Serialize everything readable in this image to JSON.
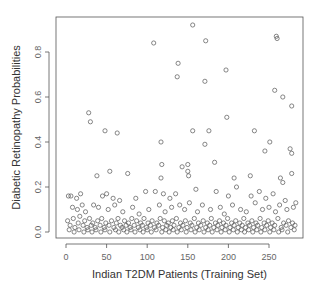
{
  "chart_data": {
    "type": "scatter",
    "title": "",
    "xlabel": "Indian T2DM Patients (Training Set)",
    "ylabel": "Diabetic Retinopathy Probabilities",
    "xlim": [
      -7,
      297
    ],
    "ylim": [
      -0.02,
      0.94
    ],
    "xticks": [
      0,
      50,
      100,
      150,
      200,
      250
    ],
    "yticks": [
      0.0,
      0.2,
      0.4,
      0.6,
      0.8
    ],
    "xtick_labels": [
      "0",
      "50",
      "100",
      "150",
      "200",
      "250"
    ],
    "ytick_labels": [
      "0.0",
      "0.2",
      "0.4",
      "0.6",
      "0.8"
    ],
    "grid": false,
    "legend": null,
    "marker": "open-circle",
    "marker_color": "#555555",
    "points": [
      [
        156,
        0.92
      ],
      [
        108,
        0.84
      ],
      [
        172,
        0.85
      ],
      [
        259,
        0.87
      ],
      [
        260,
        0.86
      ],
      [
        138,
        0.75
      ],
      [
        137,
        0.69
      ],
      [
        197,
        0.72
      ],
      [
        171,
        0.67
      ],
      [
        257,
        0.63
      ],
      [
        267,
        0.6
      ],
      [
        278,
        0.56
      ],
      [
        28,
        0.53
      ],
      [
        30,
        0.49
      ],
      [
        198,
        0.51
      ],
      [
        48,
        0.45
      ],
      [
        63,
        0.44
      ],
      [
        117,
        0.4
      ],
      [
        156,
        0.45
      ],
      [
        176,
        0.45
      ],
      [
        232,
        0.45
      ],
      [
        171,
        0.39
      ],
      [
        251,
        0.4
      ],
      [
        245,
        0.36
      ],
      [
        276,
        0.37
      ],
      [
        278,
        0.35
      ],
      [
        118,
        0.3
      ],
      [
        143,
        0.29
      ],
      [
        150,
        0.3
      ],
      [
        183,
        0.31
      ],
      [
        38,
        0.25
      ],
      [
        54,
        0.27
      ],
      [
        76,
        0.26
      ],
      [
        150,
        0.27
      ],
      [
        151,
        0.25
      ],
      [
        117,
        0.24
      ],
      [
        207,
        0.24
      ],
      [
        227,
        0.25
      ],
      [
        278,
        0.26
      ],
      [
        264,
        0.24
      ],
      [
        267,
        0.22
      ],
      [
        3,
        0.16
      ],
      [
        6,
        0.16
      ],
      [
        13,
        0.15
      ],
      [
        18,
        0.17
      ],
      [
        45,
        0.16
      ],
      [
        50,
        0.17
      ],
      [
        58,
        0.15
      ],
      [
        66,
        0.14
      ],
      [
        86,
        0.15
      ],
      [
        98,
        0.18
      ],
      [
        110,
        0.18
      ],
      [
        120,
        0.17
      ],
      [
        128,
        0.15
      ],
      [
        135,
        0.17
      ],
      [
        160,
        0.19
      ],
      [
        185,
        0.18
      ],
      [
        200,
        0.16
      ],
      [
        210,
        0.2
      ],
      [
        228,
        0.16
      ],
      [
        238,
        0.18
      ],
      [
        246,
        0.15
      ],
      [
        255,
        0.17
      ],
      [
        270,
        0.14
      ],
      [
        283,
        0.13
      ],
      [
        8,
        0.11
      ],
      [
        14,
        0.1
      ],
      [
        20,
        0.12
      ],
      [
        24,
        0.09
      ],
      [
        34,
        0.12
      ],
      [
        40,
        0.11
      ],
      [
        52,
        0.1
      ],
      [
        60,
        0.12
      ],
      [
        70,
        0.09
      ],
      [
        82,
        0.11
      ],
      [
        90,
        0.08
      ],
      [
        102,
        0.1
      ],
      [
        115,
        0.12
      ],
      [
        122,
        0.09
      ],
      [
        130,
        0.11
      ],
      [
        140,
        0.12
      ],
      [
        146,
        0.1
      ],
      [
        152,
        0.13
      ],
      [
        162,
        0.09
      ],
      [
        168,
        0.12
      ],
      [
        178,
        0.1
      ],
      [
        190,
        0.11
      ],
      [
        195,
        0.08
      ],
      [
        205,
        0.12
      ],
      [
        215,
        0.1
      ],
      [
        222,
        0.09
      ],
      [
        233,
        0.13
      ],
      [
        242,
        0.1
      ],
      [
        250,
        0.11
      ],
      [
        258,
        0.09
      ],
      [
        263,
        0.12
      ],
      [
        272,
        0.1
      ],
      [
        280,
        0.11
      ],
      [
        2,
        0.05
      ],
      [
        5,
        0.03
      ],
      [
        9,
        0.06
      ],
      [
        11,
        0.02
      ],
      [
        15,
        0.04
      ],
      [
        17,
        0.07
      ],
      [
        21,
        0.03
      ],
      [
        23,
        0.05
      ],
      [
        26,
        0.02
      ],
      [
        29,
        0.06
      ],
      [
        31,
        0.03
      ],
      [
        33,
        0.04
      ],
      [
        36,
        0.02
      ],
      [
        39,
        0.05
      ],
      [
        42,
        0.03
      ],
      [
        44,
        0.06
      ],
      [
        47,
        0.02
      ],
      [
        49,
        0.04
      ],
      [
        53,
        0.03
      ],
      [
        56,
        0.05
      ],
      [
        59,
        0.02
      ],
      [
        62,
        0.04
      ],
      [
        64,
        0.06
      ],
      [
        67,
        0.03
      ],
      [
        69,
        0.02
      ],
      [
        72,
        0.05
      ],
      [
        74,
        0.03
      ],
      [
        77,
        0.04
      ],
      [
        79,
        0.02
      ],
      [
        81,
        0.06
      ],
      [
        84,
        0.03
      ],
      [
        87,
        0.05
      ],
      [
        89,
        0.02
      ],
      [
        92,
        0.04
      ],
      [
        94,
        0.03
      ],
      [
        96,
        0.06
      ],
      [
        99,
        0.02
      ],
      [
        101,
        0.04
      ],
      [
        104,
        0.03
      ],
      [
        106,
        0.05
      ],
      [
        109,
        0.02
      ],
      [
        112,
        0.04
      ],
      [
        114,
        0.03
      ],
      [
        116,
        0.06
      ],
      [
        119,
        0.02
      ],
      [
        121,
        0.05
      ],
      [
        124,
        0.03
      ],
      [
        126,
        0.04
      ],
      [
        129,
        0.02
      ],
      [
        131,
        0.05
      ],
      [
        133,
        0.03
      ],
      [
        136,
        0.06
      ],
      [
        139,
        0.02
      ],
      [
        141,
        0.04
      ],
      [
        144,
        0.03
      ],
      [
        147,
        0.05
      ],
      [
        149,
        0.02
      ],
      [
        153,
        0.04
      ],
      [
        155,
        0.03
      ],
      [
        158,
        0.06
      ],
      [
        161,
        0.02
      ],
      [
        163,
        0.04
      ],
      [
        166,
        0.03
      ],
      [
        169,
        0.05
      ],
      [
        172,
        0.02
      ],
      [
        174,
        0.04
      ],
      [
        177,
        0.03
      ],
      [
        179,
        0.06
      ],
      [
        182,
        0.02
      ],
      [
        184,
        0.04
      ],
      [
        187,
        0.03
      ],
      [
        189,
        0.05
      ],
      [
        192,
        0.02
      ],
      [
        194,
        0.04
      ],
      [
        197,
        0.03
      ],
      [
        199,
        0.06
      ],
      [
        202,
        0.02
      ],
      [
        204,
        0.04
      ],
      [
        207,
        0.03
      ],
      [
        209,
        0.05
      ],
      [
        212,
        0.02
      ],
      [
        214,
        0.04
      ],
      [
        217,
        0.03
      ],
      [
        219,
        0.06
      ],
      [
        221,
        0.02
      ],
      [
        224,
        0.04
      ],
      [
        226,
        0.03
      ],
      [
        229,
        0.05
      ],
      [
        231,
        0.02
      ],
      [
        234,
        0.04
      ],
      [
        236,
        0.03
      ],
      [
        239,
        0.06
      ],
      [
        241,
        0.02
      ],
      [
        244,
        0.04
      ],
      [
        247,
        0.03
      ],
      [
        249,
        0.05
      ],
      [
        252,
        0.02
      ],
      [
        254,
        0.04
      ],
      [
        257,
        0.03
      ],
      [
        261,
        0.06
      ],
      [
        265,
        0.02
      ],
      [
        268,
        0.04
      ],
      [
        271,
        0.03
      ],
      [
        274,
        0.05
      ],
      [
        277,
        0.02
      ],
      [
        279,
        0.04
      ],
      [
        282,
        0.03
      ],
      [
        4,
        0.01
      ],
      [
        10,
        0.0
      ],
      [
        16,
        0.01
      ],
      [
        22,
        0.0
      ],
      [
        27,
        0.01
      ],
      [
        32,
        0.0
      ],
      [
        37,
        0.01
      ],
      [
        43,
        0.0
      ],
      [
        48,
        0.01
      ],
      [
        54,
        0.0
      ],
      [
        61,
        0.01
      ],
      [
        65,
        0.0
      ],
      [
        71,
        0.01
      ],
      [
        75,
        0.0
      ],
      [
        80,
        0.01
      ],
      [
        85,
        0.0
      ],
      [
        91,
        0.01
      ],
      [
        95,
        0.0
      ],
      [
        100,
        0.01
      ],
      [
        105,
        0.0
      ],
      [
        111,
        0.01
      ],
      [
        118,
        0.0
      ],
      [
        123,
        0.01
      ],
      [
        127,
        0.0
      ],
      [
        132,
        0.01
      ],
      [
        137,
        0.0
      ],
      [
        142,
        0.01
      ],
      [
        148,
        0.0
      ],
      [
        154,
        0.01
      ],
      [
        159,
        0.0
      ],
      [
        164,
        0.01
      ],
      [
        170,
        0.0
      ],
      [
        175,
        0.01
      ],
      [
        180,
        0.0
      ],
      [
        186,
        0.01
      ],
      [
        191,
        0.0
      ],
      [
        196,
        0.01
      ],
      [
        201,
        0.0
      ],
      [
        206,
        0.01
      ],
      [
        211,
        0.0
      ],
      [
        216,
        0.01
      ],
      [
        220,
        0.0
      ],
      [
        225,
        0.01
      ],
      [
        230,
        0.0
      ],
      [
        235,
        0.01
      ],
      [
        240,
        0.0
      ],
      [
        245,
        0.01
      ],
      [
        251,
        0.0
      ],
      [
        256,
        0.01
      ],
      [
        262,
        0.0
      ],
      [
        266,
        0.01
      ],
      [
        273,
        0.0
      ],
      [
        281,
        0.01
      ]
    ]
  },
  "labels": {
    "xlabel": "Indian T2DM Patients (Training Set)",
    "ylabel": "Diabetic Retinopathy Probabilities"
  }
}
